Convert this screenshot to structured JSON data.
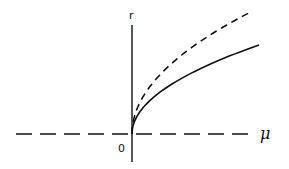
{
  "diagram": {
    "type": "bifurcation-diagram",
    "axes": {
      "vertical_label": "r",
      "horizontal_label": "μ",
      "origin_label": "0",
      "horizontal_axis_style": "dashed",
      "vertical_axis_style": "solid"
    },
    "curves": [
      {
        "name": "stable-branch",
        "style": "solid",
        "relation": "r = a·√μ",
        "coefficient": 7.9,
        "mu_max": 127
      },
      {
        "name": "unstable-branch",
        "style": "dashed",
        "relation": "r = b·√μ",
        "coefficient": 11.2,
        "mu_max": 117
      }
    ],
    "colors": {
      "line": "#111111",
      "background": "#ffffff"
    }
  }
}
